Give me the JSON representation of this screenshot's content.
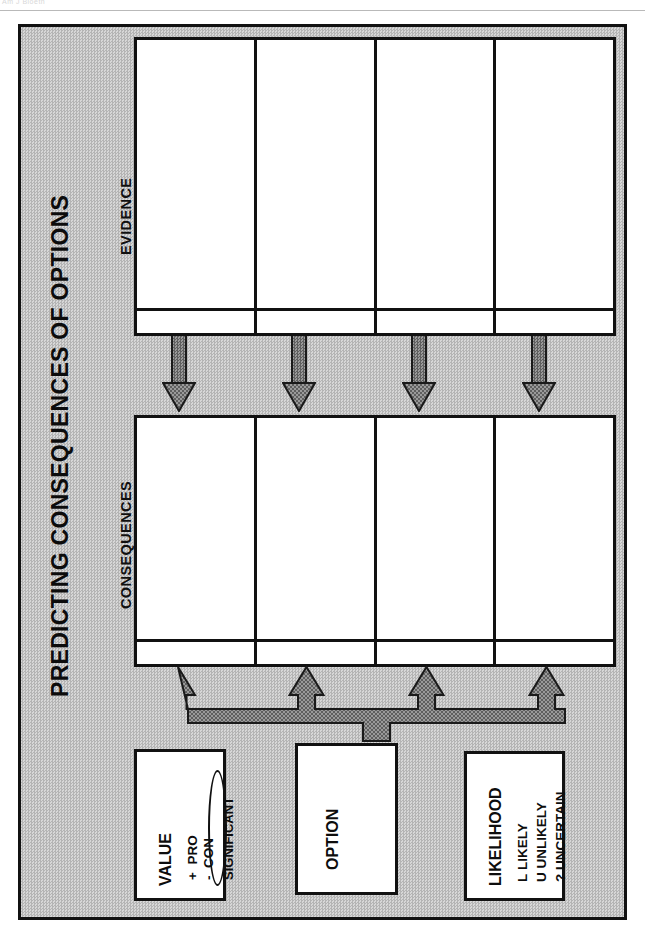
{
  "document": {
    "top_partial_text": "Am J Bioeth",
    "poster_title": "PREDICTING CONSEQUENCES OF OPTIONS"
  },
  "colors": {
    "frame_background": "#c6c6c6",
    "frame_border": "#111111",
    "cell_background": "#ffffff",
    "arrow_fill": "#7c7c7c",
    "arrow_border": "#1a1a1a",
    "text": "#0d0d0d"
  },
  "sections": {
    "evidence": {
      "label": "EVIDENCE",
      "column_count": 4,
      "columns": [
        "",
        "",
        "",
        ""
      ],
      "footer_cells": [
        "",
        "",
        "",
        ""
      ]
    },
    "consequences": {
      "label": "CONSEQUENCES",
      "column_count": 4,
      "columns": [
        "",
        "",
        "",
        ""
      ],
      "footer_cells": [
        "",
        "",
        "",
        ""
      ]
    }
  },
  "connectors": {
    "down_arrows": {
      "name": "evidence-to-consequences-arrows",
      "count": 4,
      "direction": "down"
    },
    "up_arrows": {
      "name": "option-to-consequences-manifold",
      "count": 4,
      "direction": "up"
    }
  },
  "legends": {
    "value": {
      "title": "VALUE",
      "entries": [
        {
          "symbol": "+",
          "label": "PRO"
        },
        {
          "symbol": "-",
          "label": "CON"
        }
      ],
      "highlight": "SIGNIFICANT"
    },
    "option": {
      "title": "OPTION"
    },
    "likelihood": {
      "title": "LIKELIHOOD",
      "entries": [
        {
          "symbol": "L",
          "label": "LIKELY"
        },
        {
          "symbol": "U",
          "label": "UNLIKELY"
        },
        {
          "symbol": "?",
          "label": "UNCERTAIN"
        }
      ]
    }
  }
}
